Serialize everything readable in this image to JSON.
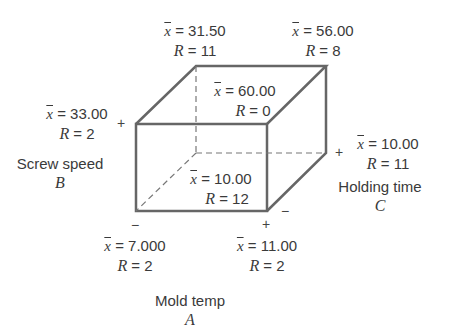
{
  "diagram": {
    "factors": {
      "A": {
        "name": "Mold temp",
        "letter": "A"
      },
      "B": {
        "name": "Screw speed",
        "letter": "B"
      },
      "C": {
        "name": "Holding time",
        "letter": "C"
      }
    },
    "signs": {
      "plus": "+",
      "minus": "−"
    },
    "xbar_symbol": "x",
    "r_symbol": "R",
    "corners": [
      {
        "id": "back-top-left",
        "xbar": "31.50",
        "R": "11"
      },
      {
        "id": "back-top-right",
        "xbar": "56.00",
        "R": "8"
      },
      {
        "id": "front-top-left",
        "xbar": "33.00",
        "R": "2"
      },
      {
        "id": "front-top-right",
        "xbar": "60.00",
        "R": "0"
      },
      {
        "id": "back-bottom-right",
        "xbar": "10.00",
        "R": "11"
      },
      {
        "id": "back-bottom-left",
        "xbar": "10.00",
        "R": "12"
      },
      {
        "id": "front-bottom-left",
        "xbar": "7.000",
        "R": "2"
      },
      {
        "id": "front-bottom-right",
        "xbar": "11.00",
        "R": "2"
      }
    ]
  }
}
